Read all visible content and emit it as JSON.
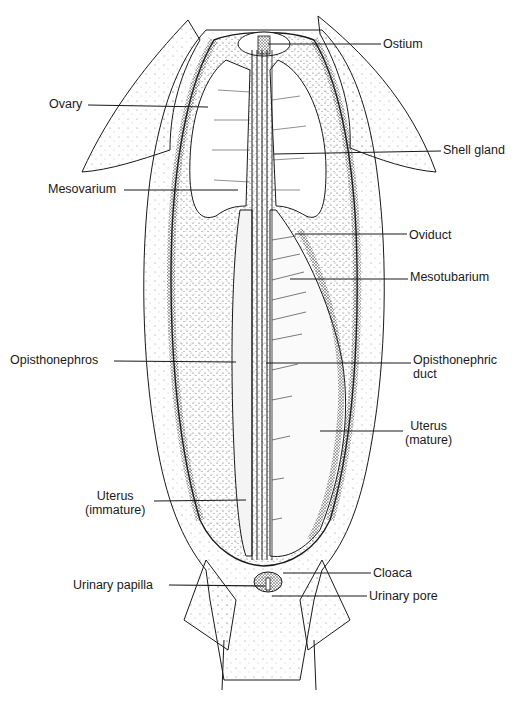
{
  "figure": {
    "labels": [
      {
        "id": "ostium",
        "text": "Ostium",
        "x": 383,
        "y": 37,
        "align": "left",
        "line": [
          [
            268,
            44
          ],
          [
            381,
            44
          ]
        ]
      },
      {
        "id": "ovary",
        "text": "Ovary",
        "x": 49,
        "y": 97,
        "align": "left",
        "line": [
          [
            88,
            105
          ],
          [
            208,
            107
          ]
        ]
      },
      {
        "id": "shell-gland",
        "text": "Shell gland",
        "x": 443,
        "y": 143,
        "align": "left",
        "line": [
          [
            274,
            154
          ],
          [
            441,
            151
          ]
        ]
      },
      {
        "id": "mesovarium",
        "text": "Mesovarium",
        "x": 48,
        "y": 182,
        "align": "left",
        "line": [
          [
            124,
            190
          ],
          [
            238,
            190
          ]
        ]
      },
      {
        "id": "oviduct",
        "text": "Oviduct",
        "x": 409,
        "y": 228,
        "align": "left",
        "line": [
          [
            295,
            234
          ],
          [
            407,
            234
          ]
        ]
      },
      {
        "id": "mesotubarium",
        "text": "Mesotubarium",
        "x": 410,
        "y": 270,
        "align": "left",
        "line": [
          [
            290,
            279
          ],
          [
            408,
            279
          ]
        ]
      },
      {
        "id": "opisthonephros",
        "text": "Opisthonephros",
        "x": 10,
        "y": 353,
        "align": "left",
        "line": [
          [
            114,
            361
          ],
          [
            236,
            362
          ]
        ]
      },
      {
        "id": "opisthonephric-duct",
        "text": "Opisthonephric\nduct",
        "x": 413,
        "y": 353,
        "align": "left",
        "line": [
          [
            266,
            363
          ],
          [
            411,
            363
          ]
        ]
      },
      {
        "id": "uterus-mature",
        "text": "Uterus\n(mature)",
        "x": 405,
        "y": 419,
        "align": "center",
        "line": [
          [
            320,
            431
          ],
          [
            403,
            431
          ]
        ]
      },
      {
        "id": "uterus-immature",
        "text": "Uterus\n(immature)",
        "x": 85,
        "y": 489,
        "align": "center",
        "line": [
          [
            154,
            501
          ],
          [
            246,
            500
          ]
        ]
      },
      {
        "id": "cloaca",
        "text": "Cloaca",
        "x": 373,
        "y": 566,
        "align": "left",
        "line": [
          [
            283,
            573
          ],
          [
            371,
            573
          ]
        ]
      },
      {
        "id": "urinary-papilla",
        "text": "Urinary papilla",
        "x": 73,
        "y": 578,
        "align": "left",
        "line": [
          [
            169,
            585
          ],
          [
            265,
            586
          ]
        ]
      },
      {
        "id": "urinary-pore",
        "text": "Urinary pore",
        "x": 369,
        "y": 589,
        "align": "left",
        "line": [
          [
            272,
            596
          ],
          [
            367,
            596
          ]
        ]
      }
    ]
  },
  "colors": {
    "ink": "#1a1a1a",
    "stipple": "#7a7a7a",
    "background": "#ffffff"
  }
}
